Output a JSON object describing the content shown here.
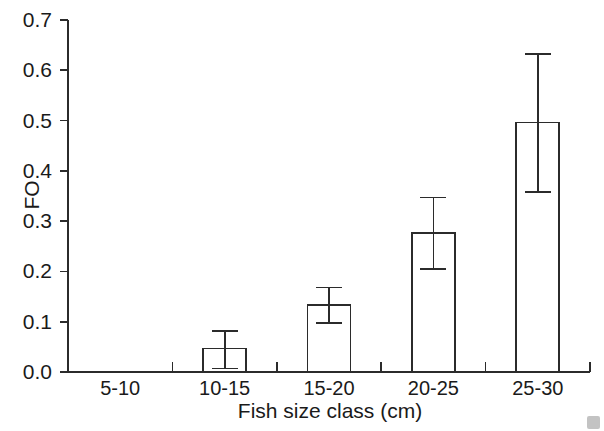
{
  "chart_data": {
    "type": "bar",
    "title": "",
    "subtitle": "",
    "xlabel": "Fish size class (cm)",
    "ylabel": "FO",
    "categories": [
      "5-10",
      "10-15",
      "15-20",
      "20-25",
      "25-30"
    ],
    "values": [
      0.0,
      0.047,
      0.133,
      0.277,
      0.496
    ],
    "error_upper": [
      0.0,
      0.081,
      0.168,
      0.347,
      0.632
    ],
    "error_lower": [
      0.0,
      0.007,
      0.097,
      0.205,
      0.358
    ],
    "ylim": [
      0.0,
      0.7
    ],
    "ytick_labels": [
      "0.0",
      "0.1",
      "0.2",
      "0.3",
      "0.4",
      "0.5",
      "0.6",
      "0.7"
    ],
    "ytick_values": [
      0.0,
      0.1,
      0.2,
      0.3,
      0.4,
      0.5,
      0.6,
      0.7
    ],
    "grid": false,
    "legend": false,
    "legend_position": "none",
    "bar_fill_color": "#ffffff",
    "bar_edge_color": "#2b2b2b",
    "error_bar_color": "#2b2b2b",
    "axis_color": "#2b2b2b",
    "background_color": "#ffffff"
  }
}
